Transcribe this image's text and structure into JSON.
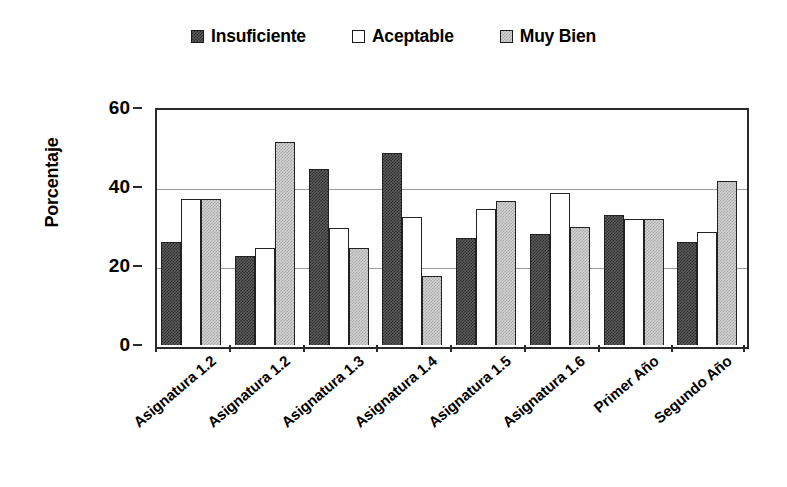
{
  "chart_data": {
    "type": "bar",
    "title": "",
    "xlabel": "",
    "ylabel": "Porcentaje",
    "ylim": [
      0,
      60
    ],
    "yticks": [
      0,
      20,
      40,
      60
    ],
    "grid": "horizontal",
    "legend_position": "top-center",
    "categories": [
      "Asignatura 1.2",
      "Asignatura 1.2",
      "Asignatura 1.3",
      "Asignatura 1.4",
      "Asignatura 1.5",
      "Asignatura 1.6",
      "Primer Año",
      "Segundo Año"
    ],
    "series": [
      {
        "name": "Insuficiente",
        "swatch": "dark-dither",
        "color": "#5d5d5d",
        "values": [
          26,
          22.5,
          44.5,
          48.5,
          27,
          28,
          33,
          26
        ]
      },
      {
        "name": "Aceptable",
        "swatch": "white",
        "color": "#ffffff",
        "values": [
          37,
          24.5,
          29.5,
          32.5,
          34.5,
          38.5,
          32,
          28.5
        ]
      },
      {
        "name": "Muy Bien",
        "swatch": "light-dither",
        "color": "#d2d2d2",
        "values": [
          37,
          51.5,
          24.5,
          17.5,
          36.5,
          30,
          32,
          41.5
        ]
      }
    ]
  },
  "legend": {
    "items": [
      {
        "label": "Insuficiente"
      },
      {
        "label": "Aceptable"
      },
      {
        "label": "Muy Bien"
      }
    ]
  },
  "axes": {
    "y_title": "Porcentaje",
    "y_tick_labels": [
      "60",
      "40",
      "20",
      "0"
    ]
  }
}
